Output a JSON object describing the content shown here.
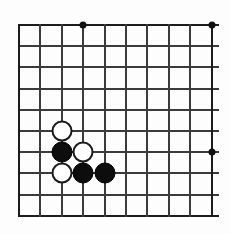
{
  "board": {
    "title": "Go board diagram",
    "kind": "go-board-fragment",
    "colors": {
      "background": "#fdfdfd",
      "grid_line": "#3b3b3b",
      "edge_line": "#1c1c1c",
      "black_stone": "#0d0d0d",
      "white_stone": "#ffffff",
      "white_stone_outline": "#1a1a1a",
      "star_point": "#111111"
    },
    "geometry": {
      "origin_x": 19,
      "origin_y": 25,
      "spacing_x": 21.4,
      "spacing_y": 21.2,
      "columns": 10,
      "rows": 10,
      "stone_diameter": 21,
      "star_point_diameter": 7,
      "line_thickness": 2,
      "horizontal_overhang": 6
    },
    "grid_columns": [
      0,
      1,
      2,
      3,
      4,
      5,
      6,
      7,
      8,
      9
    ],
    "grid_rows": [
      0,
      1,
      2,
      3,
      4,
      5,
      6,
      7,
      8,
      9
    ],
    "star_points": [
      {
        "col": 3,
        "row": 0,
        "name": "star-point-top"
      },
      {
        "col": 9,
        "row": 0,
        "name": "star-point-top-right"
      },
      {
        "col": 9,
        "row": 6,
        "name": "star-point-right"
      }
    ],
    "stones": [
      {
        "color": "white",
        "col": 2,
        "row": 5,
        "label": "white-stone-c5"
      },
      {
        "color": "black",
        "col": 2,
        "row": 6,
        "label": "black-stone-c6"
      },
      {
        "color": "white",
        "col": 3,
        "row": 6,
        "label": "white-stone-d6"
      },
      {
        "color": "white",
        "col": 2,
        "row": 7,
        "label": "white-stone-c7"
      },
      {
        "color": "black",
        "col": 3,
        "row": 7,
        "label": "black-stone-d7"
      },
      {
        "color": "black",
        "col": 4,
        "row": 7,
        "label": "black-stone-e7"
      }
    ],
    "counts": {
      "black_stones": 3,
      "white_stones": 3,
      "total_stones": 6,
      "star_points": 3
    }
  }
}
